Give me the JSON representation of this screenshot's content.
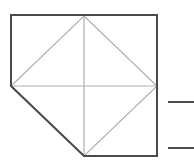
{
  "canvas": {
    "width": 194,
    "height": 167,
    "background": "#ffffff",
    "title": "Cut-corner square with inscribed diamond"
  },
  "colors": {
    "outline": "#4a4a4a",
    "inner_line": "#b0b0b0",
    "tick_line": "#4a4a4a",
    "background": "#ffffff"
  },
  "strokes": {
    "outline_width": 2,
    "inner_width": 1.2,
    "tick_width": 2
  },
  "geometry": {
    "square": {
      "left": 11,
      "top": 15,
      "right": 157,
      "bottom": 156,
      "cut_start_on_left_edge_y": 86,
      "cut_end_on_bottom_edge_x": 84
    },
    "center": {
      "x": 84,
      "y": 86
    },
    "diamond": {
      "top": {
        "x": 84,
        "y": 16
      },
      "right": {
        "x": 157,
        "y": 86
      },
      "bottom": {
        "x": 84,
        "y": 156
      },
      "left": {
        "x": 11,
        "y": 86
      }
    }
  },
  "paths": {
    "outline": "M 11 15 L 157 15 L 157 156 L 84 156 L 11 86 Z",
    "diamond": "M 84 16 L 157 86 L 84 156 L 11 86 Z",
    "vertical_axis": "M 84 16 L 84 156",
    "horizontal_axis": "M 11 86 L 157 86"
  },
  "tick_marks": [
    {
      "name": "upper-tick",
      "x1": 168,
      "y1": 102,
      "x2": 194,
      "y2": 102
    },
    {
      "name": "lower-tick",
      "x1": 168,
      "y1": 148,
      "x2": 194,
      "y2": 148
    }
  ]
}
